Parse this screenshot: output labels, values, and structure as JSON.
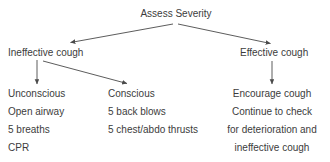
{
  "diagram": {
    "title": "Assess Severity",
    "colors": {
      "background": "#ffffff",
      "text": "#3c3c3c",
      "arrow": "#4a4a4a"
    },
    "root": {
      "label": "Assess Severity"
    },
    "branches": {
      "ineffective": {
        "label": "Ineffective cough",
        "children": {
          "unconscious": {
            "lines": [
              "Unconscious",
              "Open airway",
              "5 breaths",
              "CPR"
            ]
          },
          "conscious": {
            "lines": [
              "Conscious",
              "5 back blows",
              "5 chest/abdo thrusts"
            ]
          }
        }
      },
      "effective": {
        "label": "Effective cough",
        "children": {
          "encourage": {
            "lines": [
              "Encourage cough",
              "Continue to check",
              "for deterioration and",
              "ineffective cough"
            ]
          }
        }
      }
    },
    "connectors": [
      {
        "name": "root-to-ineffective",
        "from": "Assess Severity",
        "to": "Ineffective cough"
      },
      {
        "name": "root-to-effective",
        "from": "Assess Severity",
        "to": "Effective cough"
      },
      {
        "name": "ineffective-to-unconscious",
        "from": "Ineffective cough",
        "to": "Unconscious"
      },
      {
        "name": "ineffective-to-conscious",
        "from": "Ineffective cough",
        "to": "Conscious"
      },
      {
        "name": "effective-to-encourage",
        "from": "Effective cough",
        "to": "Encourage cough"
      }
    ]
  }
}
